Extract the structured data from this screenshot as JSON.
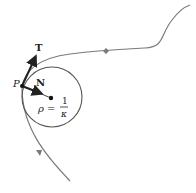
{
  "diagram": {
    "labels": {
      "tangent": "T",
      "normal": "N",
      "point": "P",
      "rho": "ρ =",
      "frac_num": "1",
      "frac_den": "κ"
    },
    "colors": {
      "curve": "#7a7a7a",
      "vectors": "#222222",
      "circle": "#555555"
    }
  }
}
